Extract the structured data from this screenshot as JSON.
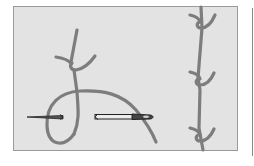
{
  "illustration": {
    "subject": "embroidery-knot-stitch",
    "background_color": "#e3e3e3",
    "border_color": "#9a9a9a",
    "thread_color": "#7d7d7d",
    "needle_color": "#333333",
    "left_panel": {
      "elements": [
        "thread-loop",
        "knot",
        "needle-left-segment",
        "needle-right-with-eye"
      ]
    },
    "right_panel": {
      "knot_count": 3
    }
  }
}
